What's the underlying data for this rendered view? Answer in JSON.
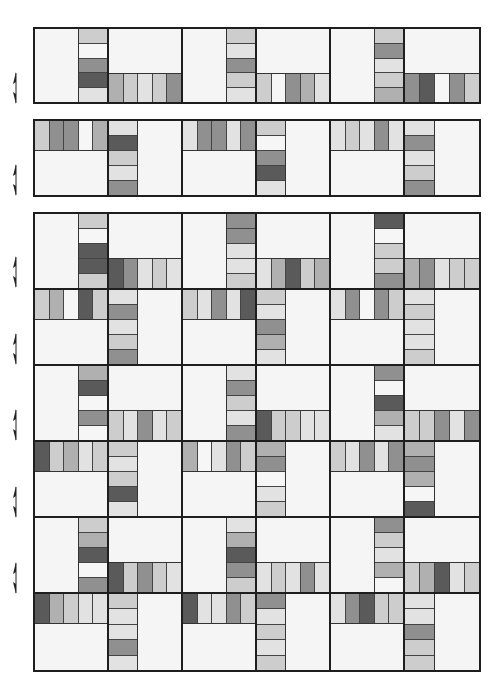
{
  "palette": {
    "W": "#f6f6f6",
    "L": "#e2e2e2",
    "M1": "#cdcdcd",
    "M2": "#b0b0b0",
    "M3": "#909090",
    "D": "#5a5a5a"
  },
  "layout": {
    "panels": [
      {
        "name": "strip-row-1",
        "top": 27,
        "height": 77,
        "rows": 1
      },
      {
        "name": "strip-row-2",
        "top": 119,
        "height": 78,
        "rows": 1
      },
      {
        "name": "main-quilt",
        "top": 212,
        "height": 460,
        "rows": 6
      }
    ],
    "arrow_positions_y": [
      88,
      180,
      272,
      349,
      425,
      502,
      578
    ]
  },
  "panels": [
    {
      "rows": [
        [
          {
            "type": "vr",
            "bars": [
              "M1",
              "W",
              "M3",
              "D",
              "L"
            ]
          },
          {
            "type": "hb",
            "bars": [
              "M2",
              "M1",
              "L",
              "M1",
              "M3"
            ]
          },
          {
            "type": "vr",
            "bars": [
              "M1",
              "L",
              "M3",
              "M1",
              "L"
            ]
          },
          {
            "type": "hb",
            "bars": [
              "M1",
              "W",
              "M3",
              "M2",
              "L"
            ]
          },
          {
            "type": "vr",
            "bars": [
              "M1",
              "M3",
              "L",
              "M1",
              "M2"
            ]
          },
          {
            "type": "hb",
            "bars": [
              "M3",
              "D",
              "W",
              "M3",
              "M1"
            ]
          }
        ]
      ]
    },
    {
      "rows": [
        [
          {
            "type": "ht",
            "bars": [
              "M1",
              "M3",
              "M3",
              "W",
              "M2"
            ]
          },
          {
            "type": "vl",
            "bars": [
              "L",
              "D",
              "M1",
              "L",
              "M3"
            ]
          },
          {
            "type": "ht",
            "bars": [
              "L",
              "M3",
              "M3",
              "L",
              "M3"
            ]
          },
          {
            "type": "vl",
            "bars": [
              "M1",
              "W",
              "M3",
              "D",
              "L"
            ]
          },
          {
            "type": "ht",
            "bars": [
              "L",
              "M1",
              "L",
              "M3",
              "L"
            ]
          },
          {
            "type": "vl",
            "bars": [
              "L",
              "M3",
              "L",
              "M1",
              "M3"
            ]
          }
        ]
      ]
    },
    {
      "rows": [
        [
          {
            "type": "vr",
            "bars": [
              "M1",
              "W",
              "D",
              "D",
              "M1"
            ]
          },
          {
            "type": "hb",
            "bars": [
              "D",
              "M3",
              "L",
              "M1",
              "L"
            ]
          },
          {
            "type": "vr",
            "bars": [
              "M3",
              "M3",
              "L",
              "L",
              "M1"
            ]
          },
          {
            "type": "hb",
            "bars": [
              "L",
              "M2",
              "D",
              "M1",
              "M2"
            ]
          },
          {
            "type": "vr",
            "bars": [
              "D",
              "W",
              "M1",
              "M1",
              "M3"
            ]
          },
          {
            "type": "hb",
            "bars": [
              "M2",
              "M3",
              "L",
              "M1",
              "M1"
            ]
          }
        ],
        [
          {
            "type": "ht",
            "bars": [
              "M1",
              "M2",
              "W",
              "D",
              "M1"
            ]
          },
          {
            "type": "vl",
            "bars": [
              "L",
              "M3",
              "L",
              "M1",
              "M3"
            ]
          },
          {
            "type": "ht",
            "bars": [
              "M1",
              "L",
              "M3",
              "L",
              "D"
            ]
          },
          {
            "type": "vl",
            "bars": [
              "M1",
              "L",
              "M3",
              "M2",
              "L"
            ]
          },
          {
            "type": "ht",
            "bars": [
              "L",
              "M3",
              "W",
              "M3",
              "M1"
            ]
          },
          {
            "type": "vl",
            "bars": [
              "L",
              "M1",
              "L",
              "L",
              "M1"
            ]
          }
        ],
        [
          {
            "type": "vr",
            "bars": [
              "M2",
              "D",
              "W",
              "M3",
              "W"
            ]
          },
          {
            "type": "hb",
            "bars": [
              "M1",
              "L",
              "M3",
              "L",
              "M1"
            ]
          },
          {
            "type": "vr",
            "bars": [
              "L",
              "M3",
              "M1",
              "L",
              "M3"
            ]
          },
          {
            "type": "hb",
            "bars": [
              "D",
              "M1",
              "M1",
              "L",
              "L"
            ]
          },
          {
            "type": "vr",
            "bars": [
              "M3",
              "W",
              "D",
              "M2",
              "L"
            ]
          },
          {
            "type": "hb",
            "bars": [
              "M1",
              "M1",
              "M3",
              "L",
              "M3"
            ]
          }
        ],
        [
          {
            "type": "ht",
            "bars": [
              "D",
              "M1",
              "M2",
              "L",
              "M1"
            ]
          },
          {
            "type": "vl",
            "bars": [
              "M1",
              "L",
              "M1",
              "D",
              "L"
            ]
          },
          {
            "type": "ht",
            "bars": [
              "M2",
              "W",
              "L",
              "M3",
              "M1"
            ]
          },
          {
            "type": "vl",
            "bars": [
              "M2",
              "M3",
              "W",
              "L",
              "M1"
            ]
          },
          {
            "type": "ht",
            "bars": [
              "M1",
              "L",
              "M3",
              "L",
              "M3"
            ]
          },
          {
            "type": "vl",
            "bars": [
              "M2",
              "M3",
              "M2",
              "W",
              "D"
            ]
          }
        ],
        [
          {
            "type": "vr",
            "bars": [
              "M1",
              "M2",
              "D",
              "W",
              "M3"
            ]
          },
          {
            "type": "hb",
            "bars": [
              "D",
              "M1",
              "M3",
              "M1",
              "L"
            ]
          },
          {
            "type": "vr",
            "bars": [
              "L",
              "M2",
              "D",
              "M3",
              "M1"
            ]
          },
          {
            "type": "hb",
            "bars": [
              "L",
              "M1",
              "L",
              "M3",
              "L"
            ]
          },
          {
            "type": "vr",
            "bars": [
              "M3",
              "M1",
              "L",
              "M2",
              "W"
            ]
          },
          {
            "type": "hb",
            "bars": [
              "M1",
              "M2",
              "D",
              "L",
              "M1"
            ]
          }
        ],
        [
          {
            "type": "ht",
            "bars": [
              "D",
              "M2",
              "M1",
              "L",
              "L"
            ]
          },
          {
            "type": "vl",
            "bars": [
              "M1",
              "L",
              "L",
              "M3",
              "L"
            ]
          },
          {
            "type": "ht",
            "bars": [
              "D",
              "L",
              "L",
              "M3",
              "M1"
            ]
          },
          {
            "type": "vl",
            "bars": [
              "M3",
              "L",
              "M1",
              "L",
              "M1"
            ]
          },
          {
            "type": "ht",
            "bars": [
              "L",
              "M3",
              "D",
              "M1",
              "M1"
            ]
          },
          {
            "type": "vl",
            "bars": [
              "L",
              "L",
              "M3",
              "M1",
              "M1"
            ]
          }
        ]
      ]
    }
  ]
}
